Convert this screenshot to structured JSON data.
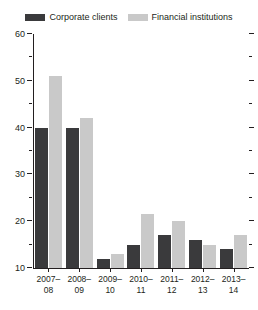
{
  "legend": {
    "position": "top-center",
    "entries": [
      {
        "label": "Corporate clients",
        "color": "#3a3a3c",
        "swatch_name": "legend-swatch-corporate-clients"
      },
      {
        "label": "Financial institutions",
        "color": "#c9c9c9",
        "swatch_name": "legend-swatch-financial-institutions"
      }
    ]
  },
  "axes": {
    "y_ticks_major": [
      "60",
      "50",
      "40",
      "30",
      "20",
      "10"
    ],
    "y_tick_values_major": [
      60,
      50,
      40,
      30,
      20,
      10
    ],
    "y_tick_values_minor": [
      55,
      45,
      35,
      25,
      15
    ],
    "ylim": [
      10,
      60
    ]
  },
  "chart_data": {
    "type": "bar",
    "title": "",
    "subtitle": "",
    "xlabel": "",
    "ylabel": "",
    "ylim": [
      10,
      60
    ],
    "grid": false,
    "legend_position": "top-center",
    "categories": [
      "2007–08",
      "2008–09",
      "2009–10",
      "2010–11",
      "2011–12",
      "2012–13",
      "2013–14"
    ],
    "category_lines": [
      [
        "2007–",
        "08"
      ],
      [
        "2008–",
        "09"
      ],
      [
        "2009–",
        "10"
      ],
      [
        "2010–",
        "11"
      ],
      [
        "2011–",
        "12"
      ],
      [
        "2012–",
        "13"
      ],
      [
        "2013–",
        "14"
      ]
    ],
    "series": [
      {
        "name": "Corporate clients",
        "color": "#3a3a3c",
        "values": [
          40,
          40,
          12,
          15,
          17,
          16,
          14
        ]
      },
      {
        "name": "Financial institutions",
        "color": "#c9c9c9",
        "values": [
          51,
          42,
          13,
          21.5,
          20,
          15,
          17
        ]
      }
    ]
  }
}
